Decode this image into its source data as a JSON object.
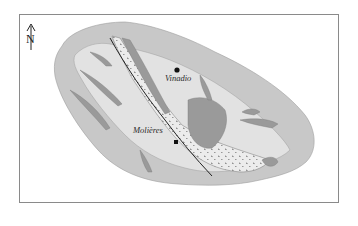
{
  "map": {
    "title": "",
    "north_arrow": {
      "label": "N",
      "icon": "north-arrow-icon"
    },
    "places": [
      {
        "name": "Vinadio",
        "x": 177,
        "y": 70,
        "label_x": 165,
        "label_y": 81
      },
      {
        "name": "Molières",
        "x": 176,
        "y": 142,
        "label_x": 133,
        "label_y": 133
      }
    ],
    "colors": {
      "outer_zone": "#c8c8c8",
      "inner_zone": "#e2e2e2",
      "dark_bodies": "#9a9a9a",
      "frame": "#8a8a8a",
      "points": "#111111"
    }
  }
}
